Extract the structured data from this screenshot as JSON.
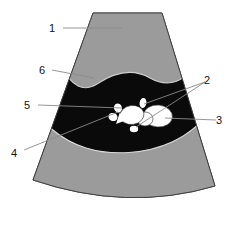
{
  "figure": {
    "type": "ultrasound-sector-schematic",
    "background_color": "#ffffff"
  },
  "colors": {
    "tissue_gray": "#9b9b9b",
    "tissue_gray_stroke": "#555555",
    "anechoic_black": "#0a0a0a",
    "echogenic_white": "#ffffff",
    "outline": "#3a3a3a",
    "leader_line": "#8a8a8a",
    "label_text": "#111111"
  },
  "regions": [
    {
      "id": "region-1",
      "name": "upper-tissue-band",
      "fill": "#9b9b9b",
      "description": "Upper homogeneous gray tissue region beneath the transducer face"
    },
    {
      "id": "region-6",
      "name": "upper-anechoic-band",
      "fill": "#0a0a0a",
      "description": "Upper dark anechoic band"
    },
    {
      "id": "region-lower-anechoic",
      "name": "lower-anechoic-pocket",
      "fill": "#0a0a0a",
      "description": "Lower dark anechoic pocket containing echogenic structures"
    },
    {
      "id": "region-lower-tissue",
      "name": "lower-tissue-band",
      "fill": "#9b9b9b",
      "description": "Lower homogeneous gray tissue region"
    }
  ],
  "echogenic_structures": [
    {
      "name": "blob-small-left",
      "cx": 118,
      "cy": 108,
      "rx": 4.0,
      "ry": 4.6,
      "rot": -20
    },
    {
      "name": "blob-small-left-lower",
      "cx": 113,
      "cy": 117,
      "rx": 4.6,
      "ry": 4.0,
      "rot": 25
    },
    {
      "name": "blob-tiny-upper",
      "cx": 143,
      "cy": 103,
      "rx": 3.4,
      "ry": 5.0,
      "rot": 10
    },
    {
      "name": "blob-mid-main",
      "cx": 132,
      "cy": 115,
      "rx": 12.0,
      "ry": 9.5,
      "rot": -8
    },
    {
      "name": "blob-right-main",
      "cx": 158,
      "cy": 116,
      "rx": 14.5,
      "ry": 11.0,
      "rot": 6
    },
    {
      "name": "blob-bridge",
      "cx": 145,
      "cy": 119,
      "rx": 8.0,
      "ry": 7.0,
      "rot": 0
    },
    {
      "name": "blob-tiny-bottom",
      "cx": 134,
      "cy": 129,
      "rx": 4.2,
      "ry": 3.2,
      "rot": 0
    }
  ],
  "callouts": [
    {
      "id": "1",
      "label": "1",
      "text_x": 52,
      "text_y": 32,
      "target": "upper-tissue-band"
    },
    {
      "id": "6",
      "label": "6",
      "text_x": 42,
      "text_y": 74,
      "target": "upper-anechoic-band"
    },
    {
      "id": "5",
      "label": "5",
      "text_x": 27,
      "text_y": 109,
      "target": "echogenic-left-cluster"
    },
    {
      "id": "4",
      "label": "4",
      "text_x": 14,
      "text_y": 157,
      "target": "echogenic-left-small"
    },
    {
      "id": "2",
      "label": "2",
      "text_x": 207,
      "text_y": 84,
      "target": "echogenic-tiny-structures"
    },
    {
      "id": "3",
      "label": "3",
      "text_x": 219,
      "text_y": 124,
      "target": "echogenic-right-main"
    }
  ]
}
